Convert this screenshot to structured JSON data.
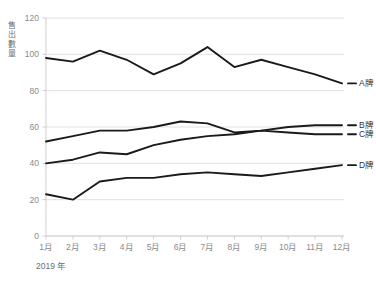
{
  "chart_data": {
    "type": "line",
    "title": "",
    "subtitle": "",
    "xlabel": "2019 年",
    "ylabel": "售出數量",
    "categories": [
      "1月",
      "2月",
      "3月",
      "4月",
      "5月",
      "6月",
      "7月",
      "8月",
      "9月",
      "10月",
      "11月",
      "12月"
    ],
    "ylim": [
      0,
      120
    ],
    "yticks": [
      0,
      20,
      40,
      60,
      80,
      100,
      120
    ],
    "ytick_labels": [
      "0",
      "20",
      "40",
      "60",
      "80",
      "100",
      "120"
    ],
    "grid": true,
    "grid_axis": "y",
    "legend_position": "right",
    "series": [
      {
        "name": "A牌",
        "color": "#1a1a1a",
        "values": [
          98,
          96,
          102,
          97,
          89,
          95,
          104,
          93,
          97,
          93,
          89,
          84
        ]
      },
      {
        "name": "B牌",
        "color": "#1a1a1a",
        "values": [
          52,
          55,
          58,
          58,
          60,
          63,
          62,
          57,
          58,
          60,
          61,
          61
        ]
      },
      {
        "name": "C牌",
        "color": "#1a1a1a",
        "values": [
          40,
          42,
          46,
          45,
          50,
          53,
          55,
          56,
          58,
          57,
          56,
          56
        ]
      },
      {
        "name": "D牌",
        "color": "#1a1a1a",
        "values": [
          23,
          20,
          30,
          32,
          32,
          34,
          35,
          34,
          33,
          35,
          37,
          39
        ]
      }
    ]
  },
  "axes": {
    "y_axis_title": "售出數量",
    "x_axis_title": "2019 年"
  },
  "legend": {
    "entries": [
      {
        "label": "A牌"
      },
      {
        "label": "B牌"
      },
      {
        "label": "C牌"
      },
      {
        "label": "D牌"
      }
    ]
  }
}
